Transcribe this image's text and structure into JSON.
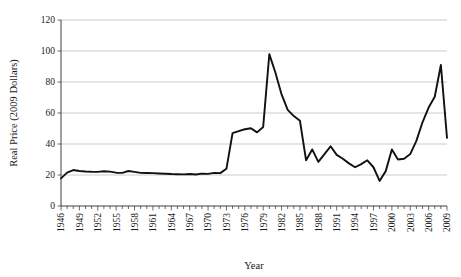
{
  "chart_data": {
    "type": "line",
    "title": "",
    "xlabel": "Year",
    "ylabel": "Real Price (2009 Dollars)",
    "xlim": [
      1946,
      2009
    ],
    "ylim": [
      0,
      120
    ],
    "yticks": [
      0,
      20,
      40,
      60,
      80,
      100,
      120
    ],
    "ytick_labels": [
      "0",
      "20",
      "40",
      "60",
      "80",
      "100",
      "120"
    ],
    "xtick_labels": [
      "1946",
      "1949",
      "1952",
      "1955",
      "1958",
      "1961",
      "1964",
      "1967",
      "1970",
      "1973",
      "1976",
      "1979",
      "1982",
      "1985",
      "1988",
      "1991",
      "1994",
      "1997",
      "2000",
      "2003",
      "2006",
      "2009"
    ],
    "xtick_step": 3,
    "minor_xtick_step": 1,
    "grid": "horizontal",
    "legend": "none",
    "series": [
      {
        "name": "Real Price (2009 Dollars)",
        "color": "#111111",
        "x": [
          1946,
          1947,
          1948,
          1949,
          1950,
          1951,
          1952,
          1953,
          1954,
          1955,
          1956,
          1957,
          1958,
          1959,
          1960,
          1961,
          1962,
          1963,
          1964,
          1965,
          1966,
          1967,
          1968,
          1969,
          1970,
          1971,
          1972,
          1973,
          1974,
          1975,
          1976,
          1977,
          1978,
          1979,
          1980,
          1981,
          1982,
          1983,
          1984,
          1985,
          1986,
          1987,
          1988,
          1989,
          1990,
          1991,
          1992,
          1993,
          1994,
          1995,
          1996,
          1997,
          1998,
          1999,
          2000,
          2001,
          2002,
          2003,
          2004,
          2005,
          2006,
          2007,
          2008,
          2009
        ],
        "values": [
          17.8,
          21.5,
          23.2,
          22.6,
          22.3,
          22.1,
          22.0,
          22.4,
          22.2,
          21.5,
          21.4,
          22.6,
          22.0,
          21.4,
          21.3,
          21.2,
          21.0,
          20.8,
          20.6,
          20.5,
          20.4,
          20.6,
          20.3,
          20.9,
          20.7,
          21.4,
          21.2,
          24.0,
          47.0,
          48.3,
          49.5,
          50.2,
          47.5,
          51.0,
          98.0,
          86.0,
          72.0,
          62.0,
          58.0,
          55.0,
          29.5,
          36.5,
          28.5,
          33.5,
          38.5,
          33.0,
          30.5,
          27.5,
          25.0,
          27.0,
          29.5,
          25.0,
          16.2,
          22.5,
          36.5,
          30.0,
          30.5,
          33.5,
          42.0,
          54.0,
          63.5,
          70.5,
          91.0,
          44.0
        ]
      }
    ]
  }
}
